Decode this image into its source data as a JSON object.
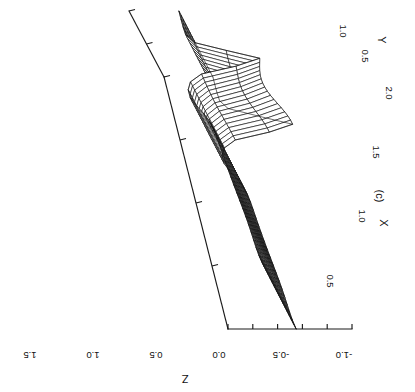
{
  "figure": {
    "caption": "(c)",
    "background": "#ffffff",
    "ink_color": "#121212",
    "rotation_note": "page rotated 90 degrees: all text reads bottom-to-top"
  },
  "axes": {
    "x": {
      "title": "X",
      "ticks": [
        "0.5",
        "1.0",
        "1.5",
        "2.0"
      ],
      "tick_values": [
        0.5,
        1.0,
        1.5,
        2.0
      ],
      "range": [
        0.0,
        2.0
      ]
    },
    "y": {
      "title": "Y",
      "ticks": [
        "0.5",
        "1.0"
      ],
      "tick_values": [
        0.5,
        1.0
      ],
      "range": [
        0.0,
        1.0
      ]
    },
    "z": {
      "title": "Z",
      "ticks": [
        "1.5",
        "1.0",
        "0.5",
        "0.0",
        "-0.5",
        "-1.0"
      ],
      "tick_values": [
        1.5,
        1.0,
        0.5,
        0.0,
        -0.5,
        -1.0
      ],
      "range": [
        -1.0,
        1.5
      ]
    }
  },
  "chart_data": {
    "type": "line",
    "plot_kind": "3d-surface-wireframe",
    "title": "(c)",
    "xlabel": "X",
    "ylabel": "Y",
    "zlabel": "Z",
    "xlim": [
      0.0,
      2.0
    ],
    "ylim": [
      0.0,
      1.0
    ],
    "zlim": [
      -1.0,
      1.5
    ],
    "grid": false,
    "legend": null,
    "mesh": {
      "nx": 33,
      "ny": 17,
      "description": "wireframe mesh surface with a broad smooth plateau rising toward small X, a steep narrow ridge near X=1.6 and a sharp folded peak crest, decaying to a flat low sheet at large X"
    },
    "surface_model": {
      "comment": "z(x,y) used to regenerate the drawn wireframe",
      "ridge_center": 1.62,
      "ridge_width": 0.085,
      "ridge_amplitude": 1.22,
      "plateau_amplitude": 0.92,
      "plateau_decay": 1.45,
      "trough_center": 1.34,
      "trough_width": 0.16,
      "trough_amplitude": -0.3,
      "y_tilt": 0.085,
      "y_ripple": 0.1,
      "base_level": -0.02
    },
    "projection": {
      "origin_px": [
        352,
        329
      ],
      "x_axis_vector_px": [
        -64.0,
        -252.0
      ],
      "y_axis_vector_px": [
        -35.0,
        -66.0
      ],
      "z_axis_vector_px": [
        -124.0,
        0.0
      ]
    }
  },
  "labels": {
    "z_ticks_px": [
      {
        "text": "1.5",
        "x": 30,
        "y": 352
      },
      {
        "text": "1.0",
        "x": 93,
        "y": 352
      },
      {
        "text": "0.5",
        "x": 156,
        "y": 352
      },
      {
        "text": "0.0",
        "x": 219,
        "y": 352
      },
      {
        "text": "-0.5",
        "x": 281,
        "y": 352
      },
      {
        "text": "-1.0",
        "x": 344,
        "y": 352
      }
    ],
    "x_ticks_px": [
      {
        "text": "0.5",
        "x": 327,
        "y": 281
      },
      {
        "text": "1.0",
        "x": 359,
        "y": 216
      },
      {
        "text": "1.5",
        "x": 373,
        "y": 152
      },
      {
        "text": "2.0",
        "x": 386,
        "y": 93
      }
    ],
    "y_ticks_px": [
      {
        "text": "0.5",
        "x": 362,
        "y": 56
      },
      {
        "text": "1.0",
        "x": 340,
        "y": 31
      }
    ],
    "z_title_px": {
      "x": 185,
      "y": 375
    },
    "x_title_px": {
      "x": 380,
      "y": 223
    },
    "y_title_px": {
      "x": 378,
      "y": 40
    },
    "caption_px": {
      "x": 376,
      "y": 196
    }
  }
}
